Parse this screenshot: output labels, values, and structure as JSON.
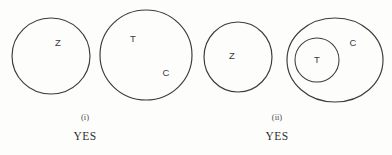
{
  "figure": {
    "type": "euler-venn-diagram",
    "background_color": "#fdfdfc",
    "stroke_color": "#3b3b3d",
    "text_color": "#3a3a3c",
    "panels": [
      {
        "id": "panel-i",
        "roman_numeral": "(i)",
        "verdict": "YES",
        "roman_x": 85,
        "roman_y": 120,
        "verdict_x": 85,
        "verdict_y": 140,
        "shapes": [
          {
            "name": "circle-z",
            "label": "Z",
            "cx": 51,
            "cy": 56,
            "rx": 39,
            "ry": 38,
            "label_x": 58,
            "label_y": 43,
            "nested": false
          },
          {
            "name": "circle-t-c",
            "label": "T",
            "secondary_label": "C",
            "cx": 146,
            "cy": 55,
            "rx": 46,
            "ry": 45,
            "label_x": 133,
            "label_y": 39,
            "secondary_label_x": 166,
            "secondary_label_y": 73,
            "nested": false
          }
        ]
      },
      {
        "id": "panel-ii",
        "roman_numeral": "(ii)",
        "verdict": "YES",
        "roman_x": 277,
        "roman_y": 120,
        "verdict_x": 277,
        "verdict_y": 140,
        "shapes": [
          {
            "name": "circle-z",
            "label": "Z",
            "cx": 238,
            "cy": 57,
            "rx": 34,
            "ry": 35,
            "label_x": 232,
            "label_y": 56,
            "nested": false
          },
          {
            "name": "ellipse-c",
            "label": "C",
            "cx": 335,
            "cy": 60,
            "rx": 48,
            "ry": 42,
            "label_x": 353,
            "label_y": 43,
            "nested": false
          },
          {
            "name": "circle-t-inner",
            "label": "T",
            "cx": 317,
            "cy": 60,
            "rx": 22,
            "ry": 22,
            "label_x": 317,
            "label_y": 60,
            "nested": true
          }
        ]
      }
    ]
  }
}
